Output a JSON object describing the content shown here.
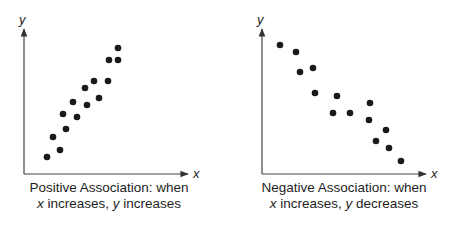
{
  "chart_data": [
    {
      "type": "scatter",
      "title": "Positive Association",
      "caption_line1": "Positive Association: when",
      "caption_line2_var1": "x",
      "caption_line2_text1": " increases, ",
      "caption_line2_var2": "y",
      "caption_line2_text2": " increases",
      "xlabel": "x",
      "ylabel": "y",
      "grid": false,
      "ticks": false,
      "points_px": [
        [
          47,
          157
        ],
        [
          53,
          137
        ],
        [
          60,
          150
        ],
        [
          63,
          114
        ],
        [
          66,
          129
        ],
        [
          73,
          102
        ],
        [
          77,
          117
        ],
        [
          85,
          88
        ],
        [
          87,
          105
        ],
        [
          94,
          81
        ],
        [
          99,
          98
        ],
        [
          108,
          81
        ],
        [
          109,
          60
        ],
        [
          118,
          60
        ],
        [
          118,
          48
        ]
      ]
    },
    {
      "type": "scatter",
      "title": "Negative Association",
      "caption_line1": "Negative Association: when",
      "caption_line2_var1": "x",
      "caption_line2_text1": " increases, ",
      "caption_line2_var2": "y",
      "caption_line2_text2": " decreases",
      "xlabel": "x",
      "ylabel": "y",
      "grid": false,
      "ticks": false,
      "points_px": [
        [
          280,
          45
        ],
        [
          296,
          52
        ],
        [
          300,
          72
        ],
        [
          313,
          68
        ],
        [
          315,
          93
        ],
        [
          337,
          96
        ],
        [
          333,
          113
        ],
        [
          350,
          113
        ],
        [
          370,
          103
        ],
        [
          369,
          120
        ],
        [
          386,
          130
        ],
        [
          376,
          141
        ],
        [
          389,
          148
        ],
        [
          401,
          161
        ]
      ]
    }
  ],
  "colors": {
    "ink": "#1a1a1a",
    "background": "#ffffff"
  }
}
